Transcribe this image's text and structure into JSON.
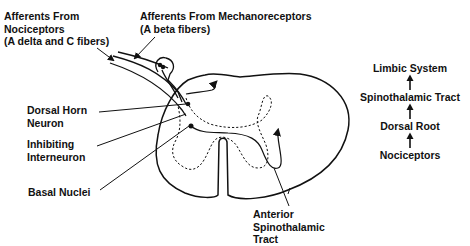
{
  "diagram": {
    "labels": {
      "nociceptor_afferents": [
        "Afferents From",
        "Nociceptors",
        "(A delta and C fibers)"
      ],
      "mechanoreceptor_afferents": [
        "Afferents From Mechanoreceptors",
        "(A beta fibers)"
      ],
      "dorsal_horn_neuron": [
        "Dorsal Horn",
        "Neuron"
      ],
      "inhibiting_interneuron": [
        "Inhibiting",
        "Interneuron"
      ],
      "basal_nuclei": [
        "Basal Nuclei"
      ],
      "anterior_spinothalamic_tract": [
        "Anterior",
        "Spinothalamic",
        "Tract"
      ]
    },
    "flow": {
      "direction": "bottom-to-top",
      "steps": [
        "Limbic System",
        "Spinothalamic Tract",
        "Dorsal Root",
        "Nociceptors"
      ],
      "arrow_icon": "up-arrow-icon"
    },
    "colors": {
      "line": "#111111",
      "background": "#ffffff"
    }
  }
}
